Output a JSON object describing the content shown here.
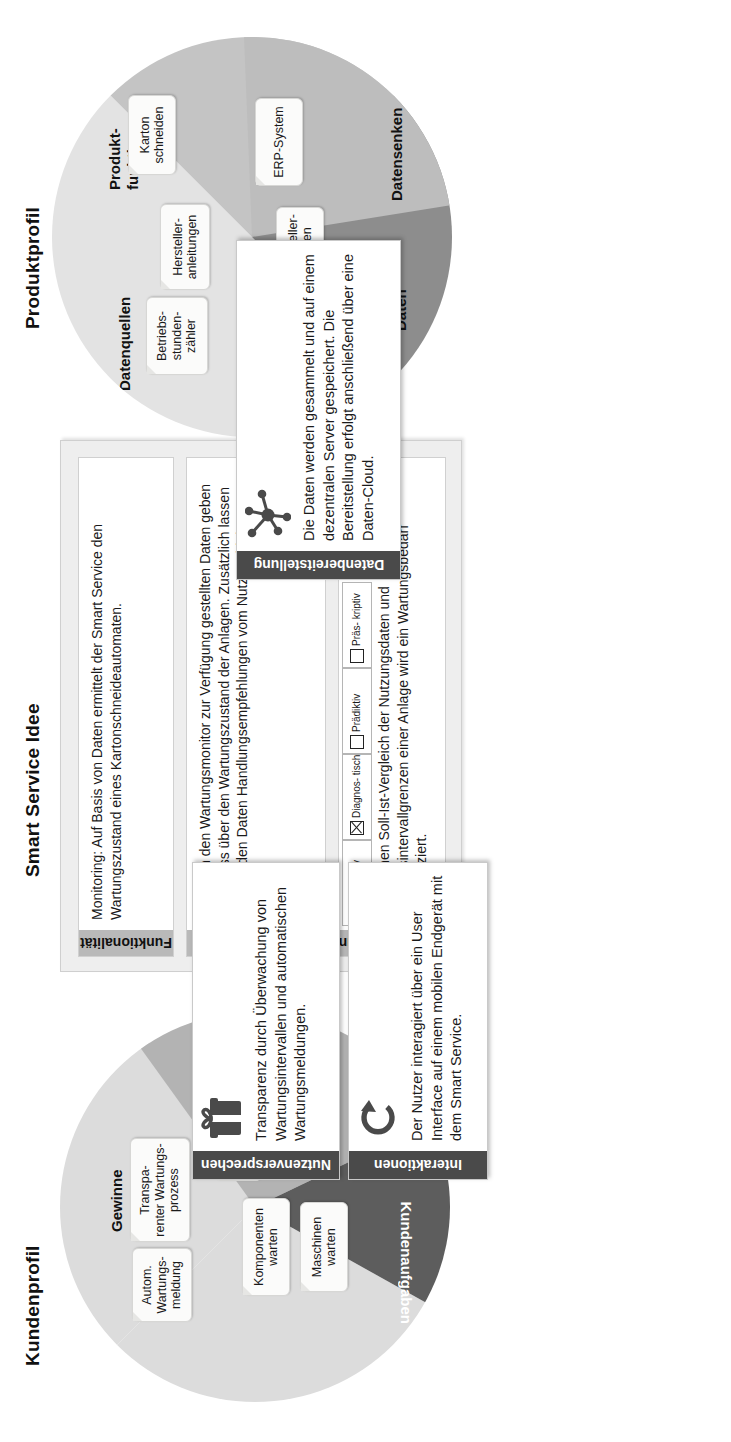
{
  "sections": {
    "produktprofil": "Produktprofil",
    "smart_service_idee": "Smart Service Idee",
    "kundenprofil": "Kundenprofil"
  },
  "colors": {
    "segment_light": "#e0e0e0",
    "segment_mid": "#bdbdbd",
    "segment_dark": "#8f8f8f",
    "segment_darkest": "#636363",
    "panel_header": "#b9b9b9",
    "card_header": "#4a4a4a",
    "note_bg": "#fbfbfa",
    "frame_bg": "#eeeeee"
  },
  "produktprofil": {
    "segments": [
      {
        "label": "Datenquellen",
        "fill": "#e3e3e3"
      },
      {
        "label": "Produkt-\nfunktionen",
        "fill": "#c4c4c4"
      },
      {
        "label": "Daten",
        "fill": "#8d8d8d"
      },
      {
        "label": "Datensenken",
        "fill": "#bdbdbd"
      }
    ],
    "segment_labels": {
      "datenquellen": "Datenquellen",
      "produktfunktionen_line1": "Produkt-",
      "produktfunktionen_line2": "funktionen",
      "daten": "Daten",
      "datensenken": "Datensenken"
    },
    "notes": [
      {
        "lines": [
          "Betriebs-",
          "stunden-",
          "zähler"
        ]
      },
      {
        "lines": [
          "Hersteller-",
          "anleitungen"
        ]
      },
      {
        "lines": [
          "Karton",
          "schneiden"
        ]
      },
      {
        "lines": [
          "ERP-System"
        ]
      },
      {
        "lines": [
          "Hersteller-",
          "daten"
        ]
      },
      {
        "lines": [
          "Betriebs-",
          "stunden"
        ]
      }
    ]
  },
  "kundenprofil": {
    "segments": [
      {
        "label": "Gewinne",
        "fill": "#dcdcdc"
      },
      {
        "label": "Probleme",
        "fill": "#b3b3b3"
      },
      {
        "label": "Kundenaufgaben",
        "fill": "#5d5d5d"
      }
    ],
    "segment_labels": {
      "gewinne": "Gewinne",
      "probleme": "Probleme",
      "kundenaufgaben": "Kundenaufgaben"
    },
    "notes": [
      {
        "lines": [
          "Autom.",
          "Wartungs-",
          "meldung"
        ]
      },
      {
        "lines": [
          "Transpa-",
          "renter Wartungs-",
          "prozess"
        ]
      },
      {
        "lines": [
          "Undurchsichtiger",
          "Wartungszustand"
        ]
      },
      {
        "lines": [
          "Komponenten",
          "warten"
        ]
      },
      {
        "lines": [
          "Maschinen",
          "warten"
        ]
      }
    ]
  },
  "smart_service_idee": {
    "funktionalitaet": {
      "title": "Funktionalität",
      "text": "Monitoring: Auf Basis von Daten ermittelt der Smart Service den Wartungszustand eines Kartonschneideautomaten."
    },
    "erkenntnisse": {
      "title": "Erkenntnisse",
      "text": "Die durch den Wartungsmonitor zur Verfügung gestellten Daten geben Aufschluss über den Wartungszustand der Anlagen. Zusätzlich lassen sich aus den Daten Handlungsempfehlungen vom Nutzer ableiten."
    },
    "datenverarbeitung": {
      "title": "Datenverarbeitung",
      "text": "Durch einen Soll-Ist-Vergleich der Nutzungsdaten und Wartungsintervallgrenzen einer Anlage wird ein Wartungsbedarf diagnostiziert.",
      "options": [
        {
          "label": "Deskriptiv",
          "label_lines": [
            "Deskriptiv"
          ],
          "checked": false
        },
        {
          "label": "Diagnostisch",
          "label_lines": [
            "Diagnos-",
            "tisch"
          ],
          "checked": true
        },
        {
          "label": "Prädiktiv",
          "label_lines": [
            "Prädiktiv"
          ],
          "checked": false
        },
        {
          "label": "Präskriptiv",
          "label_lines": [
            "Präs-",
            "kriptiv"
          ],
          "checked": false
        }
      ]
    },
    "datenbereitstellung": {
      "title": "Datenbereitstellung",
      "icon": "network-hub-icon",
      "text": "Die Daten werden gesammelt und auf einem dezentralen Server gespeichert. Die Bereitstellung erfolgt anschließend über eine Daten-Cloud."
    },
    "nutzenversprechen": {
      "title": "Nutzenversprechen",
      "icon": "gift-icon",
      "text": "Transparenz durch Überwachung von Wartungsintervallen und automatischen Wartungsmeldungen."
    },
    "interaktionen": {
      "title": "Interaktionen",
      "icon": "refresh-cycle-icon",
      "text": "Der Nutzer interagiert über ein User Interface auf einem mobilen Endgerät mit dem Smart Service."
    }
  }
}
